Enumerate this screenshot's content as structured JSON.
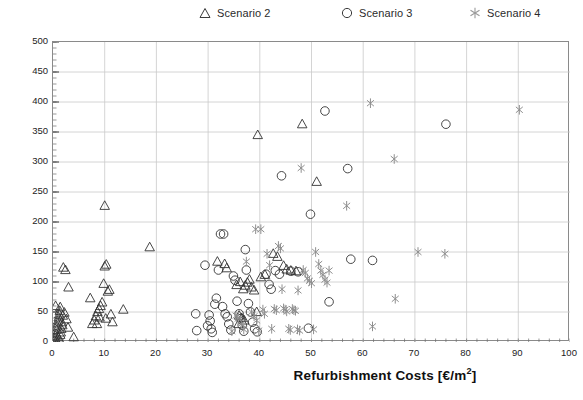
{
  "chart_data": {
    "type": "scatter",
    "title": "",
    "xlabel": "Refurbishment Costs [€/m²]",
    "ylabel": "Intensity Reduction (kWh/m²/yr)",
    "xlim": [
      0,
      100
    ],
    "ylim": [
      0,
      500
    ],
    "xticks": [
      0,
      10,
      20,
      30,
      40,
      50,
      60,
      70,
      80,
      90,
      100
    ],
    "yticks": [
      0,
      50,
      100,
      150,
      200,
      250,
      300,
      350,
      400,
      450,
      500
    ],
    "grid": true,
    "legend_position": "top-center",
    "series": [
      {
        "name": "Scenario 2",
        "marker": "triangle",
        "color": "#333333",
        "points": [
          [
            0.3,
            2
          ],
          [
            0.4,
            6
          ],
          [
            0.5,
            10
          ],
          [
            0.6,
            14
          ],
          [
            0.7,
            20
          ],
          [
            0.8,
            26
          ],
          [
            0.9,
            31
          ],
          [
            1.0,
            36
          ],
          [
            1.1,
            41
          ],
          [
            1.2,
            46
          ],
          [
            1.3,
            52
          ],
          [
            1.4,
            58
          ],
          [
            0.5,
            60
          ],
          [
            1.6,
            22
          ],
          [
            1.8,
            28
          ],
          [
            1.5,
            16
          ],
          [
            1.0,
            8
          ],
          [
            1.2,
            4
          ],
          [
            2.0,
            124
          ],
          [
            2.4,
            120
          ],
          [
            3.0,
            91
          ],
          [
            4.0,
            8
          ],
          [
            1.7,
            33
          ],
          [
            1.9,
            44
          ],
          [
            2.2,
            49
          ],
          [
            2.6,
            38
          ],
          [
            2.9,
            24
          ],
          [
            1.4,
            12
          ],
          [
            7.2,
            73
          ],
          [
            7.6,
            30
          ],
          [
            8.0,
            36
          ],
          [
            8.3,
            43
          ],
          [
            8.6,
            50
          ],
          [
            8.9,
            55
          ],
          [
            9.2,
            60
          ],
          [
            9.5,
            66
          ],
          [
            9.8,
            97
          ],
          [
            10.0,
            126
          ],
          [
            10.3,
            129
          ],
          [
            10.0,
            227
          ],
          [
            10.6,
            84
          ],
          [
            10.9,
            87
          ],
          [
            11.2,
            46
          ],
          [
            11.5,
            33
          ],
          [
            10.2,
            39
          ],
          [
            9.0,
            41
          ],
          [
            8.5,
            30
          ],
          [
            13.6,
            54
          ],
          [
            18.7,
            158
          ],
          [
            31.8,
            134
          ],
          [
            33.2,
            130
          ],
          [
            33.6,
            123
          ],
          [
            35.5,
            95
          ],
          [
            36.2,
            100
          ],
          [
            36.8,
            88
          ],
          [
            37.2,
            94
          ],
          [
            37.6,
            99
          ],
          [
            38.0,
            104
          ],
          [
            38.4,
            91
          ],
          [
            38.9,
            86
          ],
          [
            39.4,
            50
          ],
          [
            36.0,
            44
          ],
          [
            36.5,
            40
          ],
          [
            37.0,
            36
          ],
          [
            35.9,
            30
          ],
          [
            39.6,
            345
          ],
          [
            44.6,
            127
          ],
          [
            45.2,
            121
          ],
          [
            46.0,
            119
          ],
          [
            47.0,
            118
          ],
          [
            48.2,
            363
          ],
          [
            51.0,
            267
          ],
          [
            42.6,
            147
          ],
          [
            43.4,
            142
          ],
          [
            41.0,
            112
          ],
          [
            40.2,
            108
          ]
        ]
      },
      {
        "name": "Scenario 3",
        "marker": "circle",
        "color": "#333333",
        "points": [
          [
            27.6,
            47
          ],
          [
            27.8,
            19
          ],
          [
            29.4,
            128
          ],
          [
            29.9,
            27
          ],
          [
            30.2,
            45
          ],
          [
            30.4,
            35
          ],
          [
            30.6,
            22
          ],
          [
            30.8,
            16
          ],
          [
            31.3,
            63
          ],
          [
            31.6,
            73
          ],
          [
            32.0,
            120
          ],
          [
            32.4,
            180
          ],
          [
            33.0,
            180
          ],
          [
            32.8,
            59
          ],
          [
            33.3,
            47
          ],
          [
            33.7,
            42
          ],
          [
            34.0,
            30
          ],
          [
            34.4,
            20
          ],
          [
            34.9,
            110
          ],
          [
            35.2,
            103
          ],
          [
            35.6,
            68
          ],
          [
            36.0,
            47
          ],
          [
            36.3,
            39
          ],
          [
            36.6,
            28
          ],
          [
            36.9,
            18
          ],
          [
            37.2,
            154
          ],
          [
            37.4,
            120
          ],
          [
            37.8,
            64
          ],
          [
            38.2,
            50
          ],
          [
            38.6,
            33
          ],
          [
            39.0,
            22
          ],
          [
            39.5,
            17
          ],
          [
            41.2,
            113
          ],
          [
            41.8,
            96
          ],
          [
            42.2,
            88
          ],
          [
            43.0,
            119
          ],
          [
            43.8,
            113
          ],
          [
            44.2,
            277
          ],
          [
            46.0,
            118
          ],
          [
            47.4,
            117
          ],
          [
            49.4,
            23
          ],
          [
            49.8,
            213
          ],
          [
            52.6,
            385
          ],
          [
            53.4,
            67
          ],
          [
            57.0,
            289
          ],
          [
            57.6,
            138
          ],
          [
            61.8,
            136
          ],
          [
            76.0,
            363
          ]
        ]
      },
      {
        "name": "Scenario 4",
        "marker": "asterisk",
        "color": "#8f8f8f",
        "points": [
          [
            34.6,
            18
          ],
          [
            35.4,
            44
          ],
          [
            35.8,
            39
          ],
          [
            36.4,
            30
          ],
          [
            36.9,
            21
          ],
          [
            37.4,
            134
          ],
          [
            38.4,
            50
          ],
          [
            38.9,
            43
          ],
          [
            39.4,
            36
          ],
          [
            39.2,
            188
          ],
          [
            40.2,
            188
          ],
          [
            39.8,
            19
          ],
          [
            40.6,
            54
          ],
          [
            40.9,
            47
          ],
          [
            41.4,
            147
          ],
          [
            41.9,
            128
          ],
          [
            42.3,
            22
          ],
          [
            42.8,
            55
          ],
          [
            43.2,
            53
          ],
          [
            43.6,
            160
          ],
          [
            44.0,
            156
          ],
          [
            44.3,
            88
          ],
          [
            44.6,
            56
          ],
          [
            44.9,
            54
          ],
          [
            45.2,
            51
          ],
          [
            45.6,
            22
          ],
          [
            45.9,
            20
          ],
          [
            46.3,
            55
          ],
          [
            46.6,
            53
          ],
          [
            46.9,
            52
          ],
          [
            47.3,
            21
          ],
          [
            47.7,
            19
          ],
          [
            48.0,
            290
          ],
          [
            47.4,
            86
          ],
          [
            48.4,
            120
          ],
          [
            48.8,
            115
          ],
          [
            49.2,
            106
          ],
          [
            49.6,
            102
          ],
          [
            50.0,
            98
          ],
          [
            50.4,
            21
          ],
          [
            50.8,
            150
          ],
          [
            51.4,
            130
          ],
          [
            51.8,
            119
          ],
          [
            52.2,
            112
          ],
          [
            52.6,
            104
          ],
          [
            53.0,
            99
          ],
          [
            53.4,
            119
          ],
          [
            56.8,
            227
          ],
          [
            61.4,
            398
          ],
          [
            61.8,
            26
          ],
          [
            66.0,
            305
          ],
          [
            66.2,
            72
          ],
          [
            70.6,
            150
          ],
          [
            75.8,
            147
          ],
          [
            90.2,
            387
          ]
        ]
      }
    ]
  },
  "legend": {
    "items": [
      {
        "label": "Scenario 2",
        "marker": "triangle-icon"
      },
      {
        "label": "Scenario 3",
        "marker": "circle-icon"
      },
      {
        "label": "Scenario 4",
        "marker": "asterisk-icon"
      }
    ]
  },
  "axes": {
    "y_title": "Intensity Reduction (kWh/m²/yr)",
    "x_title_prefix": "Refurbishment Costs [€/m",
    "x_title_sup": "2",
    "x_title_suffix": "]"
  },
  "colors": {
    "scenario2": "#333333",
    "scenario3": "#333333",
    "scenario4": "#8f8f8f",
    "grid": "#c9c9c9",
    "frame": "#8a8a8a"
  }
}
